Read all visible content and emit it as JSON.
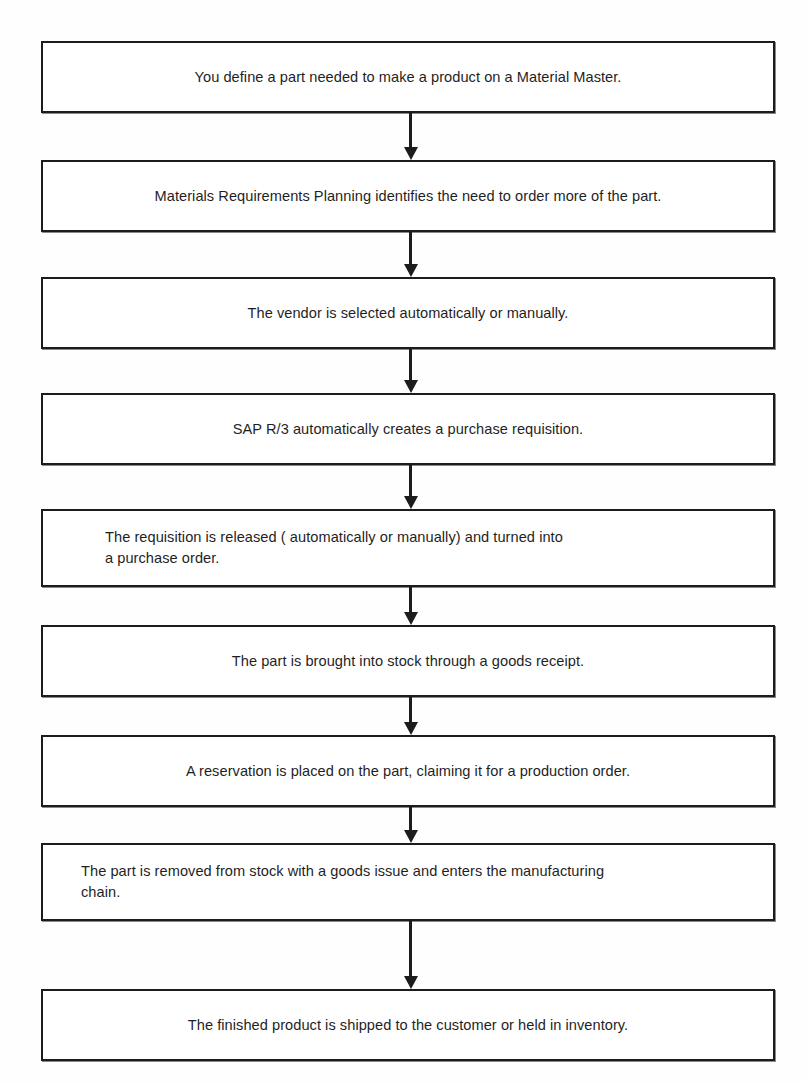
{
  "diagram": {
    "type": "flowchart",
    "orientation": "vertical-top-to-bottom",
    "background_color": "#fefefe",
    "box_fill_color": "#ffffff",
    "box_border_color": "#1c1c1c",
    "arrow_color": "#1c1c1c",
    "text_color": "#1f1f1f",
    "node_count": 9,
    "connector_count": 8,
    "nodes": [
      {
        "id": "node-1",
        "index": 1,
        "text": "You define a part needed to make a product on a Material Master.",
        "align": "center",
        "lines": 1,
        "top": 41,
        "height": 72
      },
      {
        "id": "node-2",
        "index": 2,
        "text": "Materials Requirements Planning identifies the need to order more of the part.",
        "align": "center",
        "lines": 1,
        "top": 160,
        "height": 72
      },
      {
        "id": "node-3",
        "index": 3,
        "text": "The vendor is selected automatically or manually.",
        "align": "center",
        "lines": 1,
        "top": 277,
        "height": 72
      },
      {
        "id": "node-4",
        "index": 4,
        "text": "SAP R/3 automatically creates a purchase requisition.",
        "align": "center",
        "lines": 1,
        "top": 393,
        "height": 72
      },
      {
        "id": "node-5",
        "index": 5,
        "text": "The requisition is released ( automatically or manually) and turned into\na purchase order.",
        "align": "left",
        "lines": 2,
        "top": 509,
        "height": 78
      },
      {
        "id": "node-6",
        "index": 6,
        "text": "The part is brought into stock through a goods receipt.",
        "align": "center",
        "lines": 1,
        "top": 625,
        "height": 72
      },
      {
        "id": "node-7",
        "index": 7,
        "text": "A reservation is placed on the part, claiming it for a production order.",
        "align": "center",
        "lines": 1,
        "top": 735,
        "height": 72
      },
      {
        "id": "node-8",
        "index": 8,
        "text": "The part is removed from stock with a goods issue and enters the manufacturing\nchain.",
        "align": "left",
        "lines": 2,
        "top": 843,
        "height": 78
      },
      {
        "id": "node-9",
        "index": 9,
        "text": "The finished product is shipped to the customer or held in inventory.",
        "align": "center",
        "lines": 1,
        "top": 989,
        "height": 72
      }
    ],
    "connectors": [
      {
        "id": "connector-1",
        "from": "node-1",
        "to": "node-2",
        "icon": "down-arrow-icon",
        "top": 113,
        "length": 47
      },
      {
        "id": "connector-2",
        "from": "node-2",
        "to": "node-3",
        "icon": "down-arrow-icon",
        "top": 232,
        "length": 45
      },
      {
        "id": "connector-3",
        "from": "node-3",
        "to": "node-4",
        "icon": "down-arrow-icon",
        "top": 349,
        "length": 44
      },
      {
        "id": "connector-4",
        "from": "node-4",
        "to": "node-5",
        "icon": "down-arrow-icon",
        "top": 465,
        "length": 44
      },
      {
        "id": "connector-5",
        "from": "node-5",
        "to": "node-6",
        "icon": "down-arrow-icon",
        "top": 587,
        "length": 38
      },
      {
        "id": "connector-6",
        "from": "node-6",
        "to": "node-7",
        "icon": "down-arrow-icon",
        "top": 697,
        "length": 38
      },
      {
        "id": "connector-7",
        "from": "node-7",
        "to": "node-8",
        "icon": "down-arrow-icon",
        "top": 807,
        "length": 36
      },
      {
        "id": "connector-8",
        "from": "node-8",
        "to": "node-9",
        "icon": "down-arrow-icon",
        "top": 921,
        "length": 68
      }
    ]
  }
}
